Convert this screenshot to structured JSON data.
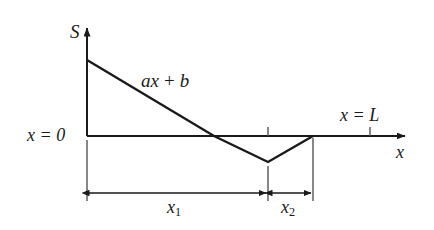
{
  "figure": {
    "kind": "line-diagram",
    "background_color": "#ffffff",
    "stroke_color": "#1a1a1a",
    "thin_stroke_color": "#555555",
    "labels": {
      "y_axis": "S",
      "x_axis": "x",
      "curve_equation_a": "ax",
      "curve_equation_op": "+",
      "curve_equation_b": "b",
      "origin": "x = 0",
      "domain_end": "x = L",
      "segment_1_var": "x",
      "segment_1_sub": "1",
      "segment_2_var": "x",
      "segment_2_sub": "2"
    }
  },
  "chart_data": {
    "type": "line",
    "title": "",
    "xlabel": "x",
    "ylabel": "S",
    "grid": false,
    "legend": null,
    "axes": {
      "x_axis_y_pixel": 136,
      "origin_x_pixel": 87,
      "x_arrow_tip_pixel": 412,
      "y_arrow_tip_pixel": 22
    },
    "series": [
      {
        "name": "S(x) = ax + b (piecewise)",
        "points_pixel": [
          {
            "x": 87,
            "y": 60
          },
          {
            "x": 214,
            "y": 136
          },
          {
            "x": 268,
            "y": 162
          },
          {
            "x": 313,
            "y": 136
          }
        ],
        "description": "Linear decrease from positive intercept b at x=0, crossing zero, reaching a minimum, then rising back to zero"
      }
    ],
    "annotations": [
      {
        "text": "ax + b",
        "role": "curve-equation",
        "x": 141,
        "y": 82
      },
      {
        "text": "x = 0",
        "role": "origin-marker",
        "x": 27,
        "y": 136
      },
      {
        "text": "x = L",
        "role": "domain-end-marker",
        "x": 340,
        "y": 116
      },
      {
        "text": "x1",
        "role": "dimension-label",
        "x": 178,
        "y": 208
      },
      {
        "text": "x2",
        "role": "dimension-label",
        "x": 291,
        "y": 208
      }
    ],
    "ticks": [
      {
        "axis": "x",
        "pixel": 268,
        "label": ""
      },
      {
        "axis": "x",
        "pixel": 370,
        "label": "x = L"
      }
    ],
    "dimensions": [
      {
        "name": "x1",
        "from_pixel": 87,
        "to_pixel": 268,
        "y_pixel": 193
      },
      {
        "name": "x2",
        "from_pixel": 270,
        "to_pixel": 313,
        "y_pixel": 193
      }
    ]
  }
}
